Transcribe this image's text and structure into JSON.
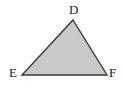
{
  "figure": {
    "type": "triangle",
    "background_color": "#ffffff",
    "fill_color": "#c9c9c9",
    "stroke_color": "#3a3a3a",
    "stroke_width": "1.4",
    "label_color": "#1b1b1b",
    "vertices": [
      {
        "id": "D",
        "label": "D",
        "x": 73,
        "y": 20,
        "label_x": 69,
        "label_y": 3
      },
      {
        "id": "E",
        "label": "E",
        "x": 22,
        "y": 75,
        "label_x": 9,
        "label_y": 66
      },
      {
        "id": "F",
        "label": "F",
        "x": 107,
        "y": 75,
        "label_x": 109,
        "label_y": 66
      }
    ],
    "edges": [
      {
        "id": "DE",
        "from": "D",
        "to": "E"
      },
      {
        "id": "EF",
        "from": "E",
        "to": "F"
      },
      {
        "id": "FD",
        "from": "F",
        "to": "D"
      }
    ],
    "polygon_points": "73,20 107,75 22,75"
  }
}
